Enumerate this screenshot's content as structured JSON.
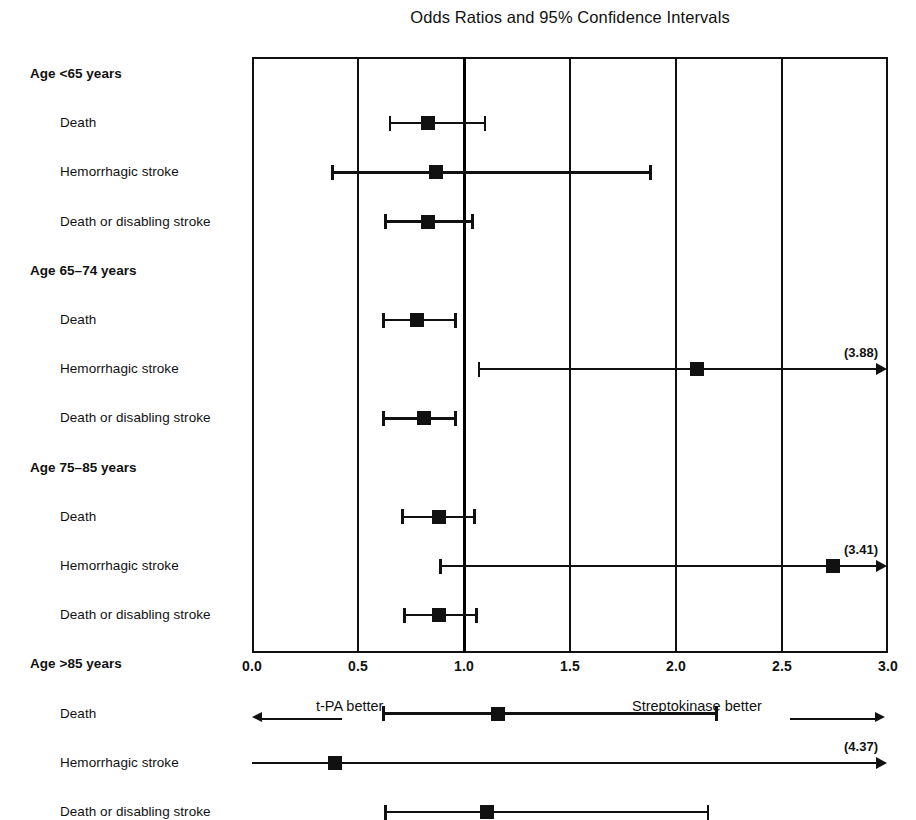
{
  "chart_data": {
    "type": "forest",
    "title": "Odds Ratios and 95% Confidence Intervals",
    "xlabel": "",
    "ylabel": "",
    "xlim": [
      0.0,
      3.0
    ],
    "xticks": [
      "0.0",
      "0.5",
      "1.0",
      "1.5",
      "2.0",
      "2.5",
      "3.0"
    ],
    "xtick_values": [
      0.0,
      0.5,
      1.0,
      1.5,
      2.0,
      2.5,
      3.0
    ],
    "grid": true,
    "reference_line": 1.0,
    "left_annotation": "t-PA better",
    "right_annotation": "Streptokinase better",
    "groups": [
      {
        "label": "Age <65 years",
        "rows": [
          {
            "label": "Death",
            "or": 0.83,
            "ci_low": 0.65,
            "ci_high": 1.1,
            "truncated": false,
            "truncated_label": ""
          },
          {
            "label": "Hemorrhagic stroke",
            "or": 0.87,
            "ci_low": 0.38,
            "ci_high": 1.88,
            "truncated": false,
            "truncated_label": ""
          },
          {
            "label": "Death or disabling stroke",
            "or": 0.83,
            "ci_low": 0.63,
            "ci_high": 1.04,
            "truncated": false,
            "truncated_label": ""
          }
        ]
      },
      {
        "label": "Age 65–74 years",
        "rows": [
          {
            "label": "Death",
            "or": 0.78,
            "ci_low": 0.62,
            "ci_high": 0.96,
            "truncated": false,
            "truncated_label": ""
          },
          {
            "label": "Hemorrhagic stroke",
            "or": 2.1,
            "ci_low": 1.07,
            "ci_high": 3.88,
            "truncated": true,
            "truncated_label": "(3.88)"
          },
          {
            "label": "Death or disabling stroke",
            "or": 0.81,
            "ci_low": 0.62,
            "ci_high": 0.96,
            "truncated": false,
            "truncated_label": ""
          }
        ]
      },
      {
        "label": "Age 75–85 years",
        "rows": [
          {
            "label": "Death",
            "or": 0.88,
            "ci_low": 0.71,
            "ci_high": 1.05,
            "truncated": false,
            "truncated_label": ""
          },
          {
            "label": "Hemorrhagic stroke",
            "or": 2.74,
            "ci_low": 0.89,
            "ci_high": 3.41,
            "truncated": true,
            "truncated_label": "(3.41)"
          },
          {
            "label": "Death or disabling stroke",
            "or": 0.88,
            "ci_low": 0.72,
            "ci_high": 1.06,
            "truncated": false,
            "truncated_label": ""
          }
        ]
      },
      {
        "label": "Age >85 years",
        "rows": [
          {
            "label": "Death",
            "or": 1.16,
            "ci_low": 0.62,
            "ci_high": 2.19,
            "truncated": false,
            "truncated_label": ""
          },
          {
            "label": "Hemorrhagic stroke",
            "or": 0.39,
            "ci_low": 0.0,
            "ci_high": 4.37,
            "truncated": true,
            "truncated_label": "(4.37)"
          },
          {
            "label": "Death or disabling stroke",
            "or": 1.11,
            "ci_low": 0.63,
            "ci_high": 2.15,
            "truncated": false,
            "truncated_label": ""
          }
        ]
      }
    ]
  },
  "colors": {
    "ink": "#111111",
    "background": "#ffffff"
  }
}
